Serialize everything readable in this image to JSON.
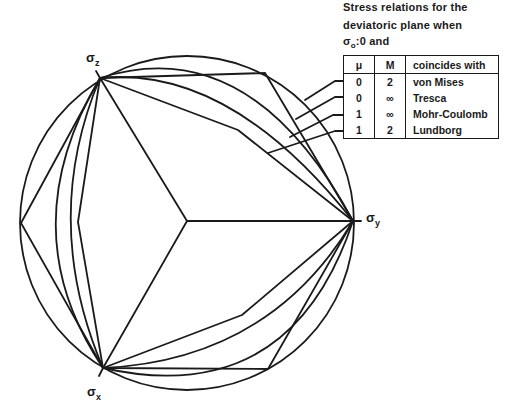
{
  "caption": {
    "line1": "Stress relations for the",
    "line2": "deviatoric  plane when",
    "line3_symbol": "σ",
    "line3_subscript": "o",
    "line3_rest": ":0  and"
  },
  "legend": {
    "headers": [
      "μ",
      "M",
      "coincides with"
    ],
    "rows": [
      {
        "mu": "0",
        "M": "2",
        "criterion": "von Mises"
      },
      {
        "mu": "0",
        "M": "∞",
        "criterion": "Tresca"
      },
      {
        "mu": "1",
        "M": "∞",
        "criterion": "Mohr-Coulomb"
      },
      {
        "mu": "1",
        "M": "2",
        "criterion": "Lundborg"
      }
    ]
  },
  "axes": {
    "z": {
      "symbol": "σ",
      "subscript": "z"
    },
    "y": {
      "symbol": "σ",
      "subscript": "y"
    },
    "x": {
      "symbol": "σ",
      "subscript": "x"
    }
  },
  "colors": {
    "line": "#1a1a1a",
    "background": "#ffffff"
  }
}
